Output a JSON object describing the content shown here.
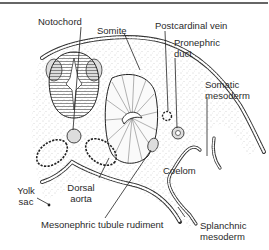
{
  "figure": {
    "colors": {
      "ink": "#2a2a2a",
      "stipple": "#c8c8c8",
      "background": "#ffffff"
    }
  },
  "labels": {
    "notochord": "Notochord",
    "somite": "Somite",
    "postcardinal_vein": "Postcardinal vein",
    "pronephric_duct_line1": "Pronephric",
    "pronephric_duct_line2": "duct",
    "somatic_mesoderm_line1": "Somatic",
    "somatic_mesoderm_line2": "mesoderm",
    "coelom": "Coelom",
    "yolk_sac_line1": "Yolk",
    "yolk_sac_line2": "sac",
    "dorsal_aorta_line1": "Dorsal",
    "dorsal_aorta_line2": "aorta",
    "mesonephric_tubule_rudiment": "Mesonephric tubule rudiment",
    "splanchnic_mesoderm_line1": "Splanchnic",
    "splanchnic_mesoderm_line2": "mesoderm"
  }
}
